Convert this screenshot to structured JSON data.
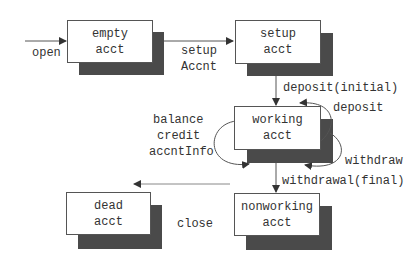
{
  "diagram": {
    "type": "state-diagram",
    "states": [
      {
        "id": "empty",
        "line1": "empty",
        "line2": "acct"
      },
      {
        "id": "setup",
        "line1": "setup",
        "line2": "acct"
      },
      {
        "id": "working",
        "line1": "working",
        "line2": "acct"
      },
      {
        "id": "nonworking",
        "line1": "nonworking",
        "line2": "acct"
      },
      {
        "id": "dead",
        "line1": "dead",
        "line2": "acct"
      }
    ],
    "transitions": {
      "open": "open",
      "setup_line1": "setup",
      "setup_line2": "Accnt",
      "deposit_initial": "deposit(initial)",
      "deposit": "deposit",
      "withdraw": "withdraw",
      "withdrawal_final": "withdrawal(final)",
      "self_loop_line1": "balance",
      "self_loop_line2": "credit",
      "self_loop_line3": "accntInfo",
      "close": "close"
    },
    "colors": {
      "shadow": "#4a4a4a",
      "line": "#555555",
      "text": "#333333"
    }
  }
}
